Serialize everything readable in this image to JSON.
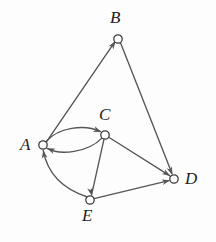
{
  "figure": {
    "name": "directed-graph",
    "type": "directed graph diagram",
    "background_color": "#fdfdfd",
    "stroke_color": "#565656",
    "node_stroke_color": "#3c3c3c",
    "node_fill_color": "#ffffff"
  },
  "nodes": [
    {
      "id": "A",
      "label": "A",
      "cx": 43,
      "cy": 145,
      "r": 4.2,
      "label_x": 20,
      "label_y": 136
    },
    {
      "id": "B",
      "label": "B",
      "cx": 118,
      "cy": 39,
      "r": 4.2,
      "label_x": 110,
      "label_y": 9
    },
    {
      "id": "C",
      "label": "C",
      "cx": 105,
      "cy": 135,
      "r": 4.2,
      "label_x": 99,
      "label_y": 106
    },
    {
      "id": "D",
      "label": "D",
      "cx": 174,
      "cy": 179,
      "r": 4.2,
      "label_x": 185,
      "label_y": 170
    },
    {
      "id": "E",
      "label": "E",
      "cx": 90,
      "cy": 200,
      "r": 4.2,
      "label_x": 82,
      "label_y": 207
    }
  ],
  "edges": [
    {
      "id": "A-B",
      "from": "A",
      "to": "B",
      "shape": "straight",
      "arrow_at": "B"
    },
    {
      "id": "B-D",
      "from": "B",
      "to": "D",
      "shape": "straight",
      "arrow_at": "D"
    },
    {
      "id": "A-C",
      "from": "A",
      "to": "C",
      "shape": "curved-upper",
      "arrow_at": "C"
    },
    {
      "id": "C-A",
      "from": "C",
      "to": "A",
      "shape": "curved-lower",
      "arrow_at": "A"
    },
    {
      "id": "C-D",
      "from": "C",
      "to": "D",
      "shape": "straight",
      "arrow_at": "D"
    },
    {
      "id": "C-E",
      "from": "C",
      "to": "E",
      "shape": "straight",
      "arrow_at": "E"
    },
    {
      "id": "E-D",
      "from": "E",
      "to": "D",
      "shape": "straight",
      "arrow_at": "D"
    },
    {
      "id": "E-A",
      "from": "E",
      "to": "A",
      "shape": "curved-left",
      "arrow_at": "A"
    }
  ],
  "edge_paths": {
    "A-B": "M 46.6,141.6 L 114.3,42.6",
    "B-D": "M 120.6,43.0 L 172.0,173.4",
    "A-C": "M 46.4,141.2 C 58,128 84,123.5 100.4,131.6",
    "C-A": "M 101.6,138.4 C 88,152.5 60,155.5 47.2,148.4",
    "C-D": "M 108.8,137.2 L 169.6,175.6",
    "C-E": "M 104.0,139.2 L 91.6,194.8",
    "E-D": "M 94.0,198.6 L 168.8,180.6",
    "E-A": "M 87.4,197.0 C 63,189 47.5,174 43.2,150.4"
  },
  "arrow_heads": [
    {
      "id": "arrow-to-B",
      "tip_x": 115.6,
      "tip_y": 41.1,
      "angle": -55.6
    },
    {
      "id": "arrow-to-D-from-B",
      "tip_x": 172.3,
      "tip_y": 174.9,
      "angle": 68.5
    },
    {
      "id": "arrow-to-C",
      "tip_x": 101.4,
      "tip_y": 132.1,
      "angle": 22.0
    },
    {
      "id": "arrow-to-A-from-C",
      "tip_x": 46.9,
      "tip_y": 148.1,
      "angle": 203.0
    },
    {
      "id": "arrow-to-D-from-C",
      "tip_x": 170.3,
      "tip_y": 176.0,
      "angle": 32.3
    },
    {
      "id": "arrow-to-E",
      "tip_x": 91.8,
      "tip_y": 195.8,
      "angle": 77.4
    },
    {
      "id": "arrow-to-D-from-E",
      "tip_x": 170.2,
      "tip_y": 180.3,
      "angle": -13.5
    },
    {
      "id": "arrow-to-A-from-E",
      "tip_x": 43.3,
      "tip_y": 150.2,
      "angle": -99.0
    }
  ]
}
